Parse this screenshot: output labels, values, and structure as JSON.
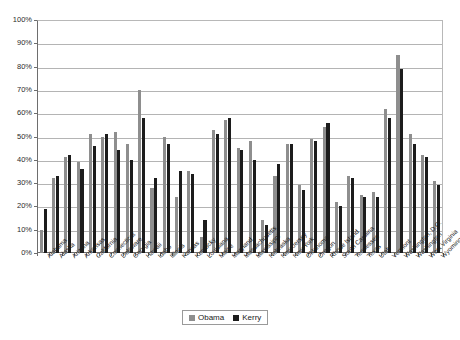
{
  "chart_data": {
    "type": "bar",
    "title": "",
    "subtitle": "",
    "xlabel": "",
    "ylabel": "",
    "ylim": [
      0,
      100
    ],
    "grid": true,
    "legend_position": "bottom",
    "y_ticks": [
      "0%",
      "10%",
      "20%",
      "30%",
      "40%",
      "50%",
      "60%",
      "70%",
      "80%",
      "90%",
      "100%"
    ],
    "y_tick_values": [
      0,
      10,
      20,
      30,
      40,
      50,
      60,
      70,
      80,
      90,
      100
    ],
    "categories": [
      "Alabama",
      "Alaska",
      "Arizona",
      "Arkansas",
      "California",
      "Connecticut",
      "Delaware",
      "Georgia",
      "Hawaii",
      "Idaho",
      "Illinois",
      "Kansas",
      "Kentucky",
      "Louisiana",
      "Maine",
      "Maryland",
      "Massachusetts",
      "Mississippi",
      "Nebraska",
      "New Jersey",
      "New York",
      "Oklahoma",
      "Oregon",
      "Rhode Island",
      "South Carolina",
      "Tennessee",
      "Texas",
      "Utah",
      "Vermont",
      "Washington, D.C.",
      "Washington",
      "West Virginia",
      "Wyoming"
    ],
    "series": [
      {
        "name": "Obama",
        "color": "#8e8e8e",
        "values": [
          10,
          32,
          41,
          39,
          51,
          50,
          52,
          47,
          70,
          28,
          50,
          24,
          35,
          7,
          53,
          57,
          45,
          48,
          14,
          33,
          47,
          29,
          49,
          54,
          22,
          33,
          25,
          26,
          62,
          85,
          51,
          42,
          31
        ]
      },
      {
        "name": "Kerry",
        "color": "#1c1c1c",
        "values": [
          19,
          33,
          42,
          36,
          46,
          51,
          44,
          40,
          58,
          32,
          47,
          35,
          34,
          14,
          51,
          58,
          44,
          40,
          12,
          38,
          47,
          27,
          48,
          56,
          20,
          32,
          24,
          24,
          58,
          79,
          47,
          41,
          29
        ]
      }
    ]
  },
  "legend": {
    "items": [
      {
        "label": "Obama",
        "color": "#8e8e8e"
      },
      {
        "label": "Kerry",
        "color": "#1c1c1c"
      }
    ]
  }
}
